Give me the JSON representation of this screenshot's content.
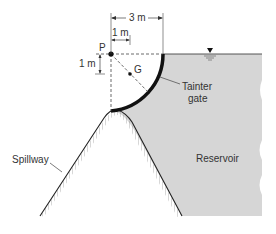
{
  "diagram": {
    "type": "tainter-gate-on-spillway",
    "labels": {
      "pivot": "P",
      "centroid": "G",
      "gate": [
        "Tainter",
        "gate"
      ],
      "reservoir": "Reservoir",
      "spillway": "Spillway"
    },
    "dimensions": {
      "gate_radius_horizontal": "3 m",
      "centroid_horizontal_offset": "1 m",
      "centroid_vertical_offset": "1 m"
    },
    "symbols": {
      "water_surface": "free-surface-triangle"
    },
    "colors": {
      "water": "#d6d6d6",
      "gate": "#111111",
      "lines": "#333333",
      "text": "#333333"
    }
  }
}
